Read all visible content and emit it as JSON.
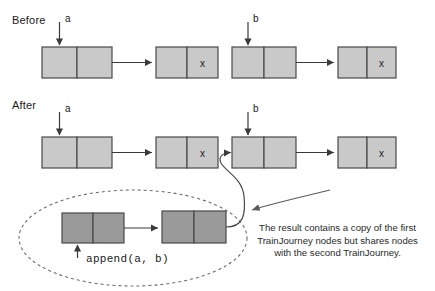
{
  "diagram": {
    "title_hidden": "",
    "sections": [
      {
        "id": "before",
        "label": "Before"
      },
      {
        "id": "after",
        "label": "After"
      }
    ],
    "pointer_labels": {
      "before_a": "a",
      "before_b": "b",
      "after_a": "a",
      "after_b": "b"
    },
    "node_marks": {
      "null_mark": "x"
    },
    "call_label": "append(a, b)",
    "note": {
      "line1": "The result contains a copy of the first",
      "line2": "TrainJourney nodes but shares nodes",
      "line3": "with the second TrainJourney."
    },
    "colors": {
      "light_node_fill": "#c9c9c9",
      "dark_node_fill": "#9a9a9a",
      "node_stroke": "#4a4a4a",
      "arrow_stroke": "#3a3a3a",
      "ellipse_stroke": "#6d6d6d",
      "text": "#1a1a1a",
      "background": "#ffffff"
    },
    "lists": {
      "before_a_list": {
        "nodes": 2,
        "tail_mark": "x"
      },
      "before_b_list": {
        "nodes": 2,
        "tail_mark": "x"
      },
      "after_a_list": {
        "nodes": 2,
        "tail_mark": "x"
      },
      "after_b_list": {
        "nodes": 2,
        "tail_mark": "x"
      },
      "result_list": {
        "nodes": 2,
        "tail_mark": ""
      }
    }
  }
}
